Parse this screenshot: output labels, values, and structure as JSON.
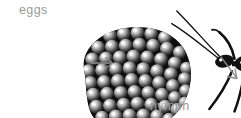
{
  "diagram": {
    "type": "life-cycle-stages",
    "background_color": "#ffffff",
    "label_color": "#9a9a9a",
    "ink_color": "#111111",
    "arrow_color": "#8c8c8c",
    "stages": [
      {
        "id": "eggs",
        "label": "eggs",
        "figure": "egg-mass-cluster",
        "description": "hexagonally packed cluster of small round eggs",
        "egg_count": 71,
        "label_position": "above"
      },
      {
        "id": "nymph",
        "label": "nymph",
        "figure": "insect-nymph",
        "description": "dark insect with long antennae, six long legs and marked abdomen",
        "label_position": "below"
      }
    ],
    "arrows": [
      {
        "id": "arrow-eggs-to-nymph",
        "glyph": "right-arrow",
        "direction": "right",
        "color": "#8c8c8c"
      },
      {
        "id": "arrow-nymph-to-next",
        "glyph": "diagonal-arrow",
        "direction": "down-right",
        "color": "#8c8c8c",
        "clipped": "true"
      }
    ]
  }
}
